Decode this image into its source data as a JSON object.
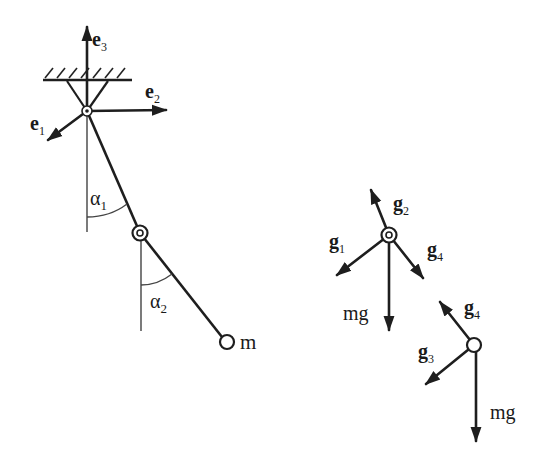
{
  "figure": {
    "type": "double pendulum free-body diagram",
    "colors": {
      "ink": "#1e1e1e",
      "background": "#ffffff"
    }
  },
  "left_diagram": {
    "basis_vectors": [
      {
        "name": "e1",
        "label": "e",
        "subscript": "1"
      },
      {
        "name": "e2",
        "label": "e",
        "subscript": "2"
      },
      {
        "name": "e3",
        "label": "e",
        "subscript": "3"
      }
    ],
    "angles": [
      {
        "name": "alpha1",
        "label": "α",
        "subscript": "1"
      },
      {
        "name": "alpha2",
        "label": "α",
        "subscript": "2"
      }
    ],
    "mass_label": "m"
  },
  "upper_joint_fbd": {
    "forces": [
      {
        "name": "g1",
        "label": "g",
        "subscript": "1"
      },
      {
        "name": "g2",
        "label": "g",
        "subscript": "2"
      },
      {
        "name": "g4",
        "label": "g",
        "subscript": "4"
      }
    ],
    "weight_label": "mg"
  },
  "lower_mass_fbd": {
    "forces": [
      {
        "name": "g3",
        "label": "g",
        "subscript": "3"
      },
      {
        "name": "g4",
        "label": "g",
        "subscript": "4"
      }
    ],
    "weight_label": "mg"
  }
}
